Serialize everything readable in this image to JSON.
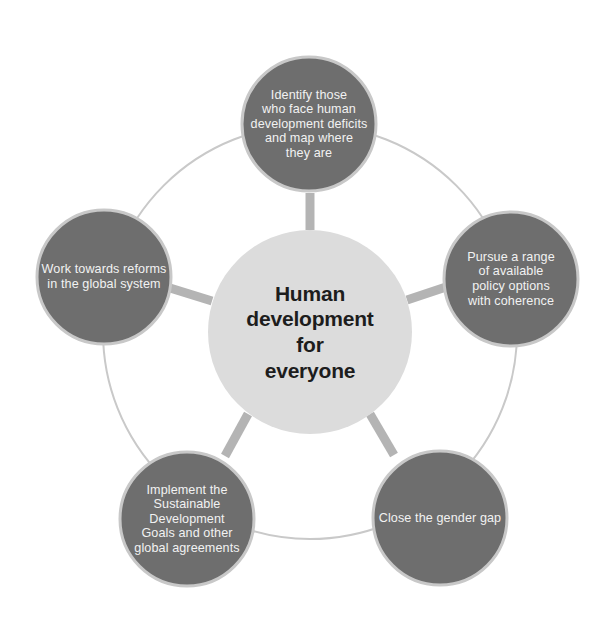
{
  "diagram": {
    "title": "Human development for everyone",
    "type": "radial hub-and-spoke cycle diagram",
    "canvas": {
      "width": 616,
      "height": 625,
      "background": "#ffffff"
    },
    "colors": {
      "outer_node_fill": "#6e6e6e",
      "outer_node_stroke": "#c8c8c8",
      "hub_fill": "#dcdcdc",
      "spoke": "#b4b4b4",
      "ring": "#c9c9c9",
      "outer_text": "#f2f2f2",
      "hub_text": "#1d1d1d"
    },
    "hub": {
      "label": "Human\ndevelopment\nfor\neveryone",
      "cx": 310,
      "cy": 332,
      "r": 102
    },
    "ring": {
      "cx": 310,
      "cy": 332,
      "r": 207,
      "stroke_width": 2
    },
    "nodes": [
      {
        "id": "identify-deficits",
        "name": "identify-deficits-node",
        "label": "Identify those\nwho face human\ndevelopment deficits\nand map where\nthey are",
        "cx": 309,
        "cy": 124,
        "r": 67,
        "angle_deg": -90
      },
      {
        "id": "policy-coherence",
        "name": "policy-coherence-node",
        "label": "Pursue a range\nof available\npolicy options\nwith coherence",
        "cx": 511,
        "cy": 279,
        "r": 67,
        "angle_deg": -18
      },
      {
        "id": "gender-gap",
        "name": "gender-gap-node",
        "label": "Close the gender gap",
        "cx": 440,
        "cy": 518,
        "r": 67,
        "angle_deg": 54
      },
      {
        "id": "sustainable-development-goals",
        "name": "sustainable-development-goals-node",
        "label": "Implement the\nSustainable Development\nGoals and other\nglobal agreements",
        "cx": 187,
        "cy": 519,
        "r": 67,
        "angle_deg": 126
      },
      {
        "id": "global-system-reforms",
        "name": "global-system-reforms-node",
        "label": "Work towards reforms\nin the global system",
        "cx": 104,
        "cy": 277,
        "r": 67,
        "angle_deg": 198
      }
    ],
    "spokes": [
      {
        "id": "spoke-identify-deficits",
        "x1": 310,
        "y1": 230,
        "x2": 310,
        "y2": 193,
        "width": 9
      },
      {
        "id": "spoke-policy-coherence",
        "x1": 407,
        "y1": 300,
        "x2": 446,
        "y2": 287,
        "width": 9
      },
      {
        "id": "spoke-gender-gap",
        "x1": 370,
        "y1": 414,
        "x2": 394,
        "y2": 455,
        "width": 9
      },
      {
        "id": "spoke-sustainable-development-goals",
        "x1": 248,
        "y1": 414,
        "x2": 225,
        "y2": 456,
        "width": 9
      },
      {
        "id": "spoke-global-system-reforms",
        "x1": 212,
        "y1": 301,
        "x2": 170,
        "y2": 288,
        "width": 9
      }
    ]
  }
}
